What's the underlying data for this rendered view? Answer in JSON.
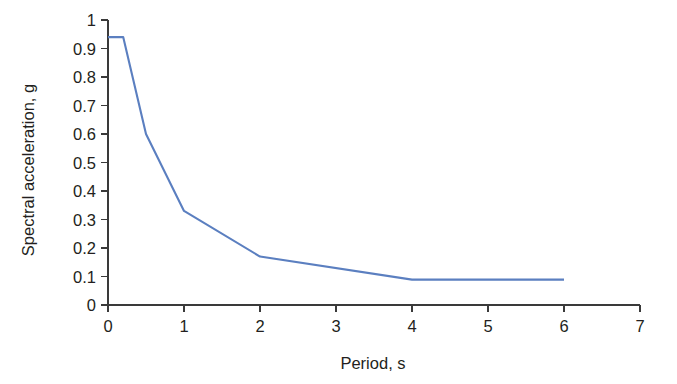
{
  "chart_data": {
    "type": "line",
    "title": "",
    "xlabel": "Period, s",
    "ylabel": "Spectral acceleration, g",
    "xlim": [
      0,
      7
    ],
    "ylim": [
      0,
      1
    ],
    "grid": false,
    "legend": "none",
    "line_color": "#5b7fc0",
    "axis_color": "#3a3a3a",
    "xticks": [
      0,
      1,
      2,
      3,
      4,
      5,
      6,
      7
    ],
    "xtick_labels": [
      "0",
      "1",
      "2",
      "3",
      "4",
      "5",
      "6",
      "7"
    ],
    "yticks": [
      0,
      0.1,
      0.2,
      0.3,
      0.4,
      0.5,
      0.6,
      0.7,
      0.8,
      0.9,
      1
    ],
    "ytick_labels": [
      "0",
      "0.1",
      "0.2",
      "0.3",
      "0.4",
      "0.5",
      "0.6",
      "0.7",
      "0.8",
      "0.9",
      "1"
    ],
    "series": [
      {
        "name": "Design response spectrum",
        "x": [
          0,
          0.2,
          0.5,
          1,
          2,
          4,
          6
        ],
        "y": [
          0.94,
          0.94,
          0.6,
          0.33,
          0.17,
          0.089,
          0.089
        ]
      }
    ]
  },
  "figure": {
    "background": "#ffffff"
  }
}
